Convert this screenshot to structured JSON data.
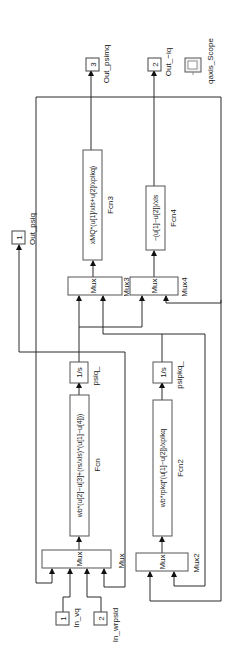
{
  "diagram": {
    "type": "simulink-block-diagram",
    "orientation": "rotated-90-ccw",
    "blocks": {
      "in_vq": {
        "number": "1",
        "label": "In_vq"
      },
      "in_wrpsid": {
        "number": "2",
        "label": "In_wrpsid"
      },
      "mux": {
        "glyph": "Mux",
        "label": "Mux"
      },
      "mux2": {
        "glyph": "Mux",
        "label": "Mux2"
      },
      "mux3": {
        "glyph": "Mux",
        "label": "Mux3"
      },
      "mux4": {
        "glyph": "Mux",
        "label": "Mux4"
      },
      "fcn": {
        "expr": "wb*(u[2]−u[3]+(rs/xls)*(u[1]−u[4]))",
        "label": "Fcn"
      },
      "fcn2": {
        "expr": "wb*rpkq*(u[1]−u[2])/xplkq",
        "label": "Fcn2"
      },
      "fcn3": {
        "expr": "xMQ*(u[1]/xls+u[2]/xplkq)",
        "label": "Fcn3"
      },
      "fcn4": {
        "expr": "−(u[1]−u[2])/xls",
        "label": "Fcn4"
      },
      "int_psiq": {
        "glyph": "1/s",
        "label": "psiq_"
      },
      "int_psipkq": {
        "glyph": "1/s",
        "label": "psipkq_"
      },
      "out_psiq": {
        "number": "1",
        "label": "Out_psiq"
      },
      "out_iq": {
        "number": "2",
        "label": "Out_−iq"
      },
      "out_psimq": {
        "number": "3",
        "label": "Out_psimq"
      },
      "scope": {
        "label": "qaxis_Scope",
        "icon": "scope-icon"
      }
    },
    "colors": {
      "line": "#2a2a2a",
      "block_border": "#555555",
      "background": "#ffffff"
    }
  }
}
